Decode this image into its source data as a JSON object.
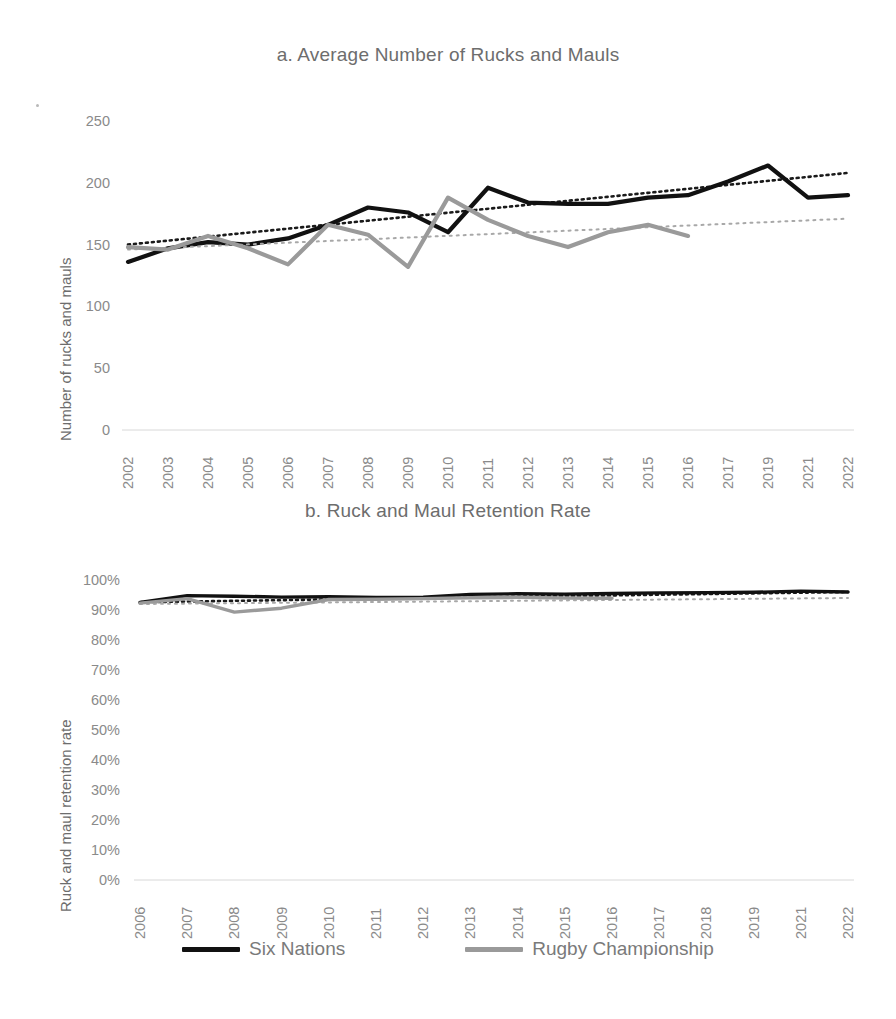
{
  "figure": {
    "background": "#ffffff",
    "series_colors": {
      "six_nations": "#111111",
      "rugby_championship": "#9a9a9a"
    },
    "trend_colors": {
      "six_nations": "#1a1a1a",
      "rugby_championship": "#a8a8a8"
    }
  },
  "legend": {
    "position": "bottom",
    "items": [
      {
        "label": "Six Nations",
        "color": "#111111"
      },
      {
        "label": "Rugby Championship",
        "color": "#9a9a9a"
      }
    ]
  },
  "chart_data": [
    {
      "id": "chart-a",
      "type": "line",
      "title": "a. Average Number of Rucks and Mauls",
      "xlabel": "",
      "ylabel": "Number of rucks and mauls",
      "ylim": [
        0,
        250
      ],
      "yticks": [
        "0",
        "50",
        "100",
        "150",
        "200",
        "250"
      ],
      "ytick_values": [
        0,
        50,
        100,
        150,
        200,
        250
      ],
      "grid": false,
      "categories": [
        "2002",
        "2003",
        "2004",
        "2005",
        "2006",
        "2007",
        "2008",
        "2009",
        "2010",
        "2011",
        "2012",
        "2013",
        "2014",
        "2015",
        "2016",
        "2017",
        "2019",
        "2021",
        "2022"
      ],
      "series": [
        {
          "name": "Six Nations",
          "color": "#111111",
          "values": [
            136,
            147,
            152,
            150,
            155,
            166,
            180,
            176,
            160,
            196,
            184,
            183,
            183,
            188,
            190,
            201,
            214,
            188,
            190
          ],
          "trendline": {
            "style": "dotted",
            "color": "#1a1a1a",
            "start": 150,
            "end": 208
          }
        },
        {
          "name": "Rugby Championship",
          "color": "#9a9a9a",
          "values": [
            148,
            146,
            157,
            147,
            134,
            166,
            158,
            132,
            188,
            170,
            157,
            148,
            160,
            166,
            157,
            null,
            null,
            null,
            null
          ],
          "trendline": {
            "style": "dotted",
            "color": "#a8a8a8",
            "start": 146,
            "end": 171
          }
        }
      ]
    },
    {
      "id": "chart-b",
      "type": "line",
      "title": "b. Ruck and Maul Retention Rate",
      "xlabel": "",
      "ylabel": "Ruck and maul retention rate",
      "ylim": [
        0,
        1
      ],
      "yticks": [
        "0%",
        "10%",
        "20%",
        "30%",
        "40%",
        "50%",
        "60%",
        "70%",
        "80%",
        "90%",
        "100%"
      ],
      "ytick_values": [
        0,
        10,
        20,
        30,
        40,
        50,
        60,
        70,
        80,
        90,
        100
      ],
      "grid": false,
      "categories": [
        "2006",
        "2007",
        "2008",
        "2009",
        "2010",
        "2011",
        "2012",
        "2013",
        "2014",
        "2015",
        "2016",
        "2017",
        "2018",
        "2019",
        "2021",
        "2022"
      ],
      "series": [
        {
          "name": "Six Nations",
          "color": "#111111",
          "values": [
            92.5,
            94.8,
            94.6,
            94.3,
            94.4,
            94.2,
            94.3,
            95.2,
            95.4,
            95.3,
            95.5,
            95.7,
            95.8,
            95.9,
            96.3,
            96.0
          ],
          "trendline": {
            "style": "dotted",
            "color": "#1a1a1a",
            "start": 92.6,
            "end": 96.0
          }
        },
        {
          "name": "Rugby Championship",
          "color": "#9a9a9a",
          "values": [
            92.3,
            93.8,
            89.3,
            90.6,
            93.5,
            93.6,
            93.8,
            94.1,
            94.2,
            94.0,
            93.9,
            null,
            null,
            null,
            null,
            null
          ],
          "trendline": {
            "style": "dotted",
            "color": "#a8a8a8",
            "start": 92.0,
            "end": 94.0
          }
        }
      ]
    }
  ]
}
